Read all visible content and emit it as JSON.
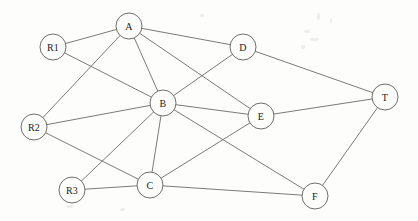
{
  "diagram": {
    "background_color": "#fdfdfc",
    "edge_color": "#6b6b6b",
    "node_fill": "#fdfdfc",
    "node_stroke": "#5e5e5e",
    "label_color": "#1a1a1a",
    "node_radius": 13
  },
  "chart_data": {
    "type": "diagram",
    "nodes": [
      {
        "id": "R1",
        "label": "R1",
        "x": 53,
        "y": 47,
        "r": 13
      },
      {
        "id": "A",
        "label": "A",
        "x": 129,
        "y": 26,
        "r": 13
      },
      {
        "id": "D",
        "label": "D",
        "x": 243,
        "y": 47,
        "r": 13
      },
      {
        "id": "T",
        "label": "T",
        "x": 385,
        "y": 97,
        "r": 13
      },
      {
        "id": "B",
        "label": "B",
        "x": 163,
        "y": 103,
        "r": 13
      },
      {
        "id": "E",
        "label": "E",
        "x": 261,
        "y": 116,
        "r": 13
      },
      {
        "id": "R2",
        "label": "R2",
        "x": 34,
        "y": 127,
        "r": 13
      },
      {
        "id": "R3",
        "label": "R3",
        "x": 72,
        "y": 190,
        "r": 13
      },
      {
        "id": "C",
        "label": "C",
        "x": 150,
        "y": 185,
        "r": 13
      },
      {
        "id": "F",
        "label": "F",
        "x": 315,
        "y": 196,
        "r": 13
      }
    ],
    "edges": [
      {
        "source": "R1",
        "target": "A"
      },
      {
        "source": "R1",
        "target": "B"
      },
      {
        "source": "A",
        "target": "D"
      },
      {
        "source": "A",
        "target": "B"
      },
      {
        "source": "A",
        "target": "E"
      },
      {
        "source": "D",
        "target": "T"
      },
      {
        "source": "D",
        "target": "B"
      },
      {
        "source": "R2",
        "target": "A"
      },
      {
        "source": "R2",
        "target": "B"
      },
      {
        "source": "R2",
        "target": "C"
      },
      {
        "source": "B",
        "target": "E"
      },
      {
        "source": "B",
        "target": "C"
      },
      {
        "source": "B",
        "target": "F"
      },
      {
        "source": "E",
        "target": "T"
      },
      {
        "source": "E",
        "target": "C"
      },
      {
        "source": "R3",
        "target": "B"
      },
      {
        "source": "R3",
        "target": "C"
      },
      {
        "source": "C",
        "target": "F"
      },
      {
        "source": "F",
        "target": "T"
      }
    ],
    "node_count": 10,
    "edge_count": 19,
    "directed": false,
    "sources": [
      "R1",
      "R2",
      "R3"
    ],
    "sink": "T"
  }
}
